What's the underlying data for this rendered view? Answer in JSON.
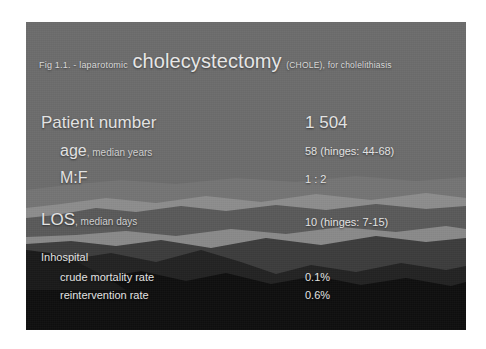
{
  "slide": {
    "title": {
      "prefix": "Fig 1.1. - laparotomic",
      "main": "cholecystectomy",
      "suffix": "(CHOLE),  for cholelithiasis"
    },
    "rows": [
      {
        "label": "Patient number",
        "sublabel": "",
        "value": "1 504"
      },
      {
        "label": "age",
        "sublabel": ", median  years",
        "value": "58 (hinges: 44-68)"
      },
      {
        "label": "M:F",
        "sublabel": "",
        "value": "1 : 2"
      },
      {
        "label": "LOS",
        "sublabel": ", median days",
        "value": "10 (hinges: 7-15)"
      }
    ],
    "section": {
      "heading": "Inhospital",
      "items": [
        {
          "label": "crude mortality rate",
          "value": "0.1%"
        },
        {
          "label": "reintervention rate",
          "value": "0.6%"
        }
      ]
    },
    "colors": {
      "sky": "#6d6d6d",
      "ridge_light": "#8d8d8d",
      "ridge_mid": "#5c5c5c",
      "ridge_dark": "#3a3a3a",
      "ridge_darker": "#242424",
      "ridge_darkest": "#101010",
      "text": "#e2e2e2",
      "page": "#ffffff"
    }
  }
}
